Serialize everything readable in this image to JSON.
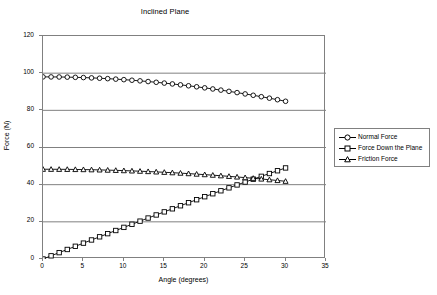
{
  "chart_data": {
    "type": "line",
    "title": "Inclined Plane",
    "xlabel": "Angle (degrees)",
    "ylabel": "Force (N)",
    "xlim": [
      0,
      35
    ],
    "ylim": [
      0,
      120
    ],
    "xticks": [
      0,
      5,
      10,
      15,
      20,
      25,
      30,
      35
    ],
    "yticks": [
      0,
      20,
      40,
      60,
      80,
      100,
      120
    ],
    "grid": "horizontal",
    "legend_position": "right",
    "x": [
      0,
      1,
      2,
      3,
      4,
      5,
      6,
      7,
      8,
      9,
      10,
      11,
      12,
      13,
      14,
      15,
      16,
      17,
      18,
      19,
      20,
      21,
      22,
      23,
      24,
      25,
      26,
      27,
      28,
      29,
      30
    ],
    "series": [
      {
        "name": "Normal Force",
        "marker": "circle",
        "color": "#000000",
        "values": [
          98.0,
          97.98,
          97.94,
          97.87,
          97.76,
          97.63,
          97.46,
          97.27,
          97.05,
          96.79,
          96.51,
          96.2,
          95.86,
          95.49,
          95.09,
          94.66,
          94.21,
          93.72,
          93.21,
          92.67,
          92.1,
          91.5,
          90.88,
          90.22,
          89.54,
          88.83,
          88.1,
          87.33,
          86.54,
          85.72,
          84.87
        ]
      },
      {
        "name": "Force Down the Plane",
        "marker": "square",
        "color": "#000000",
        "values": [
          0.0,
          1.71,
          3.42,
          5.13,
          6.84,
          8.54,
          10.24,
          11.94,
          13.64,
          15.33,
          17.02,
          18.7,
          20.37,
          22.04,
          23.7,
          25.36,
          27.01,
          28.65,
          30.28,
          31.9,
          33.52,
          35.12,
          36.71,
          38.29,
          39.86,
          41.41,
          42.95,
          44.48,
          45.99,
          47.49,
          49.0
        ]
      },
      {
        "name": "Friction Force",
        "marker": "triangle",
        "color": "#000000",
        "values": [
          48.3,
          48.29,
          48.27,
          48.24,
          48.18,
          48.12,
          48.04,
          47.94,
          47.83,
          47.7,
          47.56,
          47.41,
          47.24,
          47.06,
          46.87,
          46.66,
          46.44,
          46.2,
          45.95,
          45.68,
          45.4,
          45.11,
          44.8,
          44.48,
          44.14,
          43.79,
          43.43,
          43.05,
          42.66,
          42.25,
          41.83
        ]
      }
    ]
  },
  "legend": {
    "items": [
      {
        "label": "Normal Force"
      },
      {
        "label": "Force Down the Plane"
      },
      {
        "label": "Friction Force"
      }
    ]
  }
}
